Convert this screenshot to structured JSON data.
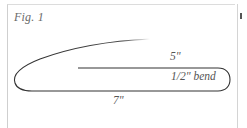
{
  "figure": {
    "label": "Fig. 1",
    "dimensions": {
      "length_5": "5\"",
      "bend": "1/2\" bend",
      "length_7": "7\""
    }
  },
  "colors": {
    "line": "#333333",
    "frame": "#cfcfcf",
    "text": "#555555"
  }
}
